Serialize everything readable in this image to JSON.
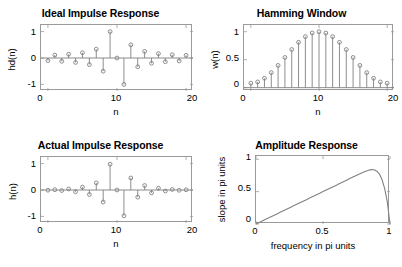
{
  "figure": {
    "background": "#ffffff",
    "axis_color": "#9a9a9a",
    "data_color": "#808080",
    "text_color": "#000000"
  },
  "chart_data": [
    {
      "type": "scatter",
      "id": "ideal-impulse-response",
      "title": "Ideal Impulse Response",
      "xlabel": "n",
      "ylabel": "hd(n)",
      "xlim": [
        -1,
        21
      ],
      "ylim": [
        -1.25,
        1.25
      ],
      "xticks": [
        0,
        10,
        20
      ],
      "xticklabels": [
        "0",
        "10",
        "20"
      ],
      "yticks": [
        -1,
        0,
        1
      ],
      "yticklabels": [
        "-1",
        "0",
        "1"
      ],
      "grid": false,
      "legend": "none",
      "marker": "circle",
      "stem": true,
      "x": [
        0,
        1,
        2,
        3,
        4,
        5,
        6,
        7,
        8,
        9,
        10,
        11,
        12,
        13,
        14,
        15,
        16,
        17,
        18,
        19,
        20
      ],
      "values": [
        -0.1,
        0.111,
        -0.125,
        0.143,
        -0.167,
        0.2,
        -0.25,
        0.333,
        -0.5,
        1.0,
        0.0,
        -1.0,
        0.5,
        -0.333,
        0.25,
        -0.2,
        0.167,
        -0.143,
        0.125,
        -0.111,
        0.1
      ]
    },
    {
      "type": "scatter",
      "id": "hamming-window",
      "title": "Hamming Window",
      "xlabel": "n",
      "ylabel": "w(n)",
      "xlim": [
        -1,
        21
      ],
      "ylim": [
        -0.06,
        1.12
      ],
      "xticks": [
        0,
        10,
        20
      ],
      "xticklabels": [
        "0",
        "10",
        "20"
      ],
      "yticks": [
        0,
        0.5,
        1
      ],
      "yticklabels": [
        "0",
        "0.5",
        "1"
      ],
      "grid": false,
      "legend": "none",
      "marker": "circle",
      "stem": true,
      "x": [
        0,
        1,
        2,
        3,
        4,
        5,
        6,
        7,
        8,
        9,
        10,
        11,
        12,
        13,
        14,
        15,
        16,
        17,
        18,
        19,
        20
      ],
      "values": [
        0.08,
        0.1025,
        0.1679,
        0.269,
        0.3979,
        0.54,
        0.6821,
        0.811,
        0.9121,
        0.9775,
        1.0,
        0.9775,
        0.9121,
        0.811,
        0.6821,
        0.54,
        0.3979,
        0.269,
        0.1679,
        0.1025,
        0.08
      ]
    },
    {
      "type": "scatter",
      "id": "actual-impulse-response",
      "title": "Actual Impulse Response",
      "xlabel": "n",
      "ylabel": "h(n)",
      "xlim": [
        -1,
        21
      ],
      "ylim": [
        -1.25,
        1.25
      ],
      "xticks": [
        0,
        10,
        20
      ],
      "xticklabels": [
        "0",
        "10",
        "20"
      ],
      "yticks": [
        -1,
        0,
        1
      ],
      "yticklabels": [
        "-1",
        "0",
        "1"
      ],
      "grid": false,
      "legend": "none",
      "marker": "circle",
      "stem": true,
      "x": [
        0,
        1,
        2,
        3,
        4,
        5,
        6,
        7,
        8,
        9,
        10,
        11,
        12,
        13,
        14,
        15,
        16,
        17,
        18,
        19,
        20
      ],
      "values": [
        -0.008,
        0.0114,
        -0.021,
        0.0384,
        -0.0663,
        0.108,
        -0.1705,
        0.2703,
        -0.4561,
        0.9775,
        0.0,
        -0.9775,
        0.4561,
        -0.2703,
        0.1705,
        -0.108,
        0.0663,
        -0.0384,
        0.021,
        -0.0114,
        0.008
      ]
    },
    {
      "type": "line",
      "id": "amplitude-response",
      "title": "Amplitude Response",
      "xlabel": "frequency in pi units",
      "ylabel": "slope in pi units",
      "xlim": [
        0,
        1
      ],
      "ylim": [
        0,
        1.05
      ],
      "xticks": [
        0,
        0.5,
        1
      ],
      "xticklabels": [
        "0",
        "0.5",
        "1"
      ],
      "yticks": [
        0,
        0.5,
        1
      ],
      "yticklabels": [
        "0",
        "0.5",
        "1"
      ],
      "grid": false,
      "legend": "none",
      "peak": {
        "x": 0.86,
        "y": 0.84
      },
      "x": [
        0,
        0.02,
        0.04,
        0.06,
        0.08,
        0.1,
        0.12,
        0.14,
        0.16,
        0.18,
        0.2,
        0.22,
        0.24,
        0.26,
        0.28,
        0.3,
        0.32,
        0.34,
        0.36,
        0.38,
        0.4,
        0.42,
        0.44,
        0.46,
        0.48,
        0.5,
        0.52,
        0.54,
        0.56,
        0.58,
        0.6,
        0.62,
        0.64,
        0.66,
        0.68,
        0.7,
        0.72,
        0.74,
        0.76,
        0.78,
        0.8,
        0.82,
        0.84,
        0.86,
        0.88,
        0.9,
        0.92,
        0.94,
        0.96,
        0.98,
        1.0
      ],
      "values": [
        0.0,
        0.02,
        0.04,
        0.06,
        0.08,
        0.1,
        0.12,
        0.14,
        0.16,
        0.18,
        0.2,
        0.22,
        0.24,
        0.26,
        0.28,
        0.3,
        0.32,
        0.34,
        0.36,
        0.38,
        0.4,
        0.42,
        0.44,
        0.46,
        0.48,
        0.5,
        0.52,
        0.54,
        0.56,
        0.58,
        0.6,
        0.62,
        0.641,
        0.661,
        0.681,
        0.701,
        0.721,
        0.741,
        0.761,
        0.78,
        0.798,
        0.815,
        0.83,
        0.84,
        0.838,
        0.82,
        0.775,
        0.69,
        0.55,
        0.34,
        0.0
      ]
    }
  ]
}
